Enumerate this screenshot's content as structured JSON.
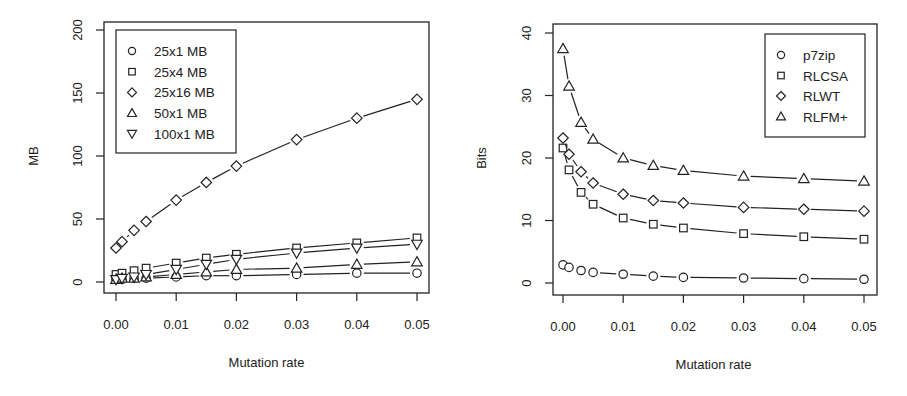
{
  "figure": {
    "panels": 2
  },
  "chart_data": [
    {
      "type": "line",
      "panel": "left",
      "title": "",
      "xlabel": "Mutation rate",
      "ylabel": "MB",
      "xlim": [
        0,
        0.05
      ],
      "ylim": [
        0,
        200
      ],
      "xticks": [
        "0.00",
        "0.01",
        "0.02",
        "0.03",
        "0.04",
        "0.05"
      ],
      "xtick_values": [
        0,
        0.01,
        0.02,
        0.03,
        0.04,
        0.05
      ],
      "yticks": [
        "0",
        "50",
        "100",
        "150",
        "200"
      ],
      "ytick_values": [
        0,
        50,
        100,
        150,
        200
      ],
      "grid": false,
      "legend_position": "top-left",
      "x": [
        0,
        0.001,
        0.003,
        0.005,
        0.01,
        0.015,
        0.02,
        0.03,
        0.04,
        0.05
      ],
      "series": [
        {
          "name": "25x1 MB",
          "marker": "circle",
          "values": [
            2,
            2,
            3,
            3,
            4,
            5,
            5,
            6,
            7,
            7
          ]
        },
        {
          "name": "25x4 MB",
          "marker": "square",
          "values": [
            6,
            7,
            9,
            11,
            15,
            19,
            22,
            27,
            31,
            35
          ]
        },
        {
          "name": "25x16 MB",
          "marker": "diamond",
          "values": [
            27,
            32,
            41,
            48,
            65,
            79,
            92,
            113,
            130,
            145
          ]
        },
        {
          "name": "50x1 MB",
          "marker": "triangle-up",
          "values": [
            2,
            3,
            3,
            4,
            6,
            8,
            10,
            11,
            14,
            16
          ]
        },
        {
          "name": "100x1 MB",
          "marker": "triangle-down",
          "values": [
            2,
            3,
            4,
            6,
            10,
            14,
            18,
            23,
            27,
            30
          ]
        }
      ]
    },
    {
      "type": "line",
      "panel": "right",
      "title": "",
      "xlabel": "Mutation rate",
      "ylabel": "Bits",
      "xlim": [
        0,
        0.05
      ],
      "ylim": [
        0,
        40
      ],
      "xticks": [
        "0.00",
        "0.01",
        "0.02",
        "0.03",
        "0.04",
        "0.05"
      ],
      "xtick_values": [
        0,
        0.01,
        0.02,
        0.03,
        0.04,
        0.05
      ],
      "yticks": [
        "0",
        "10",
        "20",
        "30",
        "40"
      ],
      "ytick_values": [
        0,
        10,
        20,
        30,
        40
      ],
      "grid": false,
      "legend_position": "top-right",
      "x": [
        0,
        0.001,
        0.003,
        0.005,
        0.01,
        0.015,
        0.02,
        0.03,
        0.04,
        0.05
      ],
      "series": [
        {
          "name": "p7zip",
          "marker": "circle",
          "values": [
            2.9,
            2.5,
            2.0,
            1.7,
            1.4,
            1.1,
            0.9,
            0.8,
            0.7,
            0.6
          ]
        },
        {
          "name": "RLCSA",
          "marker": "square",
          "values": [
            21.6,
            18.1,
            14.5,
            12.6,
            10.4,
            9.4,
            8.8,
            7.9,
            7.4,
            7.0
          ]
        },
        {
          "name": "RLWT",
          "marker": "diamond",
          "values": [
            23.2,
            20.6,
            17.8,
            16.0,
            14.2,
            13.2,
            12.8,
            12.1,
            11.8,
            11.5
          ]
        },
        {
          "name": "RLFM+",
          "marker": "triangle-up",
          "values": [
            37.5,
            31.5,
            25.7,
            23.0,
            20.0,
            18.8,
            18.0,
            17.1,
            16.7,
            16.3
          ]
        }
      ]
    }
  ],
  "colors": {
    "ink": "#222222",
    "background": "#ffffff"
  }
}
